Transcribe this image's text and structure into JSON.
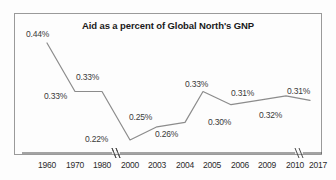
{
  "chart_data": {
    "type": "line",
    "title": "Aid as a percent of Global North's GNP",
    "xlabel": "",
    "ylabel": "",
    "grid": false,
    "legend": "none",
    "axis_breaks": [
      "1980-2000",
      "2010-2017"
    ],
    "ylim": [
      0.2,
      0.46
    ],
    "categories": [
      "1960",
      "1970",
      "1980",
      "2000",
      "2003",
      "2004",
      "2005",
      "2006",
      "2009",
      "2010",
      "2017"
    ],
    "values": [
      0.44,
      0.33,
      0.33,
      0.22,
      0.25,
      0.26,
      0.33,
      0.3,
      0.31,
      0.32,
      0.31
    ],
    "point_labels": [
      "0.44%",
      "0.33%",
      "0.33%",
      "0.22%",
      "0.25%",
      "0.26%",
      "0.33%",
      "0.30%",
      "0.31%",
      "0.32%",
      "0.31%"
    ],
    "series": [
      {
        "name": "Aid as a percent of Global North's GNP",
        "values": [
          0.44,
          0.33,
          0.33,
          0.22,
          0.25,
          0.26,
          0.33,
          0.3,
          0.31,
          0.32,
          0.31
        ]
      }
    ],
    "label_positions": [
      {
        "label": "0.44%",
        "x": 26,
        "y": 29,
        "place": "above-left"
      },
      {
        "label": "0.33%",
        "x": 44,
        "y": 91,
        "place": "below-left"
      },
      {
        "label": "0.33%",
        "x": 76,
        "y": 72,
        "place": "above"
      },
      {
        "label": "0.22%",
        "x": 88,
        "y": 134,
        "place": "left"
      },
      {
        "label": "0.25%",
        "x": 130,
        "y": 112,
        "place": "above"
      },
      {
        "label": "0.26%",
        "x": 155,
        "y": 128,
        "place": "below"
      },
      {
        "label": "0.33%",
        "x": 186,
        "y": 79,
        "place": "above"
      },
      {
        "label": "0.30%",
        "x": 208,
        "y": 117,
        "place": "below"
      },
      {
        "label": "0.31%",
        "x": 231,
        "y": 95,
        "place": "above"
      },
      {
        "label": "0.32%",
        "x": 259,
        "y": 110,
        "place": "below"
      },
      {
        "label": "0.31%",
        "x": 287,
        "y": 89,
        "place": "above"
      }
    ],
    "tick_positions": [
      {
        "label": "1960",
        "x": 47
      },
      {
        "label": "1970",
        "x": 75
      },
      {
        "label": "1980",
        "x": 102
      },
      {
        "label": "2000",
        "x": 130
      },
      {
        "label": "2003",
        "x": 157
      },
      {
        "label": "2004",
        "x": 185
      },
      {
        "label": "2005",
        "x": 203
      },
      {
        "label": "2006",
        "x": 231
      },
      {
        "label": "2009",
        "x": 258
      },
      {
        "label": "2010",
        "x": 286
      },
      {
        "label": "2017",
        "x": 310
      }
    ],
    "colors": {
      "line": "#8c8c8c",
      "axis": "#4a4a4a",
      "border": "#9a9a9a",
      "text": "#2b2b2b",
      "background": "#fdfdfd"
    }
  }
}
